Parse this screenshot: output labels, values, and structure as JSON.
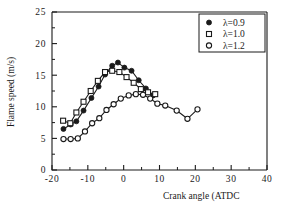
{
  "chart_data": {
    "type": "line",
    "title": "",
    "xlabel": "Crank angle (ATDC",
    "ylabel": "Flame speed (m/s)",
    "xlim": [
      -20,
      40
    ],
    "ylim": [
      0,
      25
    ],
    "xticks": [
      -20,
      -10,
      0,
      10,
      20,
      30,
      40
    ],
    "xtick_labels": [
      "-20",
      "-10",
      "0",
      "10",
      "20",
      "30",
      "40"
    ],
    "xminor_ticks": [
      -15,
      -5,
      5,
      15,
      25,
      35
    ],
    "yticks": [
      0,
      5,
      10,
      15,
      20,
      25
    ],
    "ytick_labels": [
      "0",
      "5",
      "10",
      "15",
      "20",
      "25"
    ],
    "yminor_ticks": [
      2.5,
      7.5,
      12.5,
      17.5,
      22.5
    ],
    "grid": false,
    "legend_position": "top-right",
    "series": [
      {
        "name": "λ=0.9",
        "marker": "filled-circle",
        "x": [
          -16.8,
          -14.8,
          -13.2,
          -11.2,
          -9.0,
          -7.0,
          -5.2,
          -3.2,
          -1.6,
          0.2,
          2.2,
          4.2,
          6.2,
          8.2
        ],
        "y": [
          6.5,
          7.2,
          7.7,
          9.4,
          11.4,
          13.2,
          15.1,
          16.5,
          17.0,
          16.2,
          15.7,
          14.2,
          12.9,
          11.8
        ]
      },
      {
        "name": "λ=1.0",
        "marker": "open-square",
        "x": [
          -16.9,
          -14.9,
          -13.2,
          -11.2,
          -9.2,
          -7.2,
          -5.2,
          -3.2,
          -1.2,
          0.8,
          2.8,
          4.8,
          6.8,
          8.8
        ],
        "y": [
          7.8,
          7.4,
          9.1,
          10.8,
          12.5,
          14.1,
          15.5,
          15.7,
          15.5,
          14.7,
          13.8,
          12.8,
          12.3,
          12.0
        ]
      },
      {
        "name": "λ=1.2",
        "marker": "open-circle",
        "x": [
          -16.8,
          -14.8,
          -12.8,
          -10.8,
          -8.8,
          -6.8,
          -4.8,
          -2.8,
          -0.8,
          1.4,
          3.4,
          5.4,
          7.4,
          9.4,
          11.6,
          14.8,
          17.8,
          20.6
        ],
        "y": [
          4.9,
          4.9,
          5.0,
          6.1,
          7.4,
          8.2,
          9.5,
          10.4,
          11.3,
          11.8,
          12.0,
          11.9,
          11.3,
          10.5,
          10.2,
          9.4,
          8.1,
          9.6
        ]
      }
    ]
  },
  "legend": {
    "items": [
      {
        "label": "λ=0.9",
        "marker": "filled-circle"
      },
      {
        "label": "λ=1.0",
        "marker": "open-square"
      },
      {
        "label": "λ=1.2",
        "marker": "open-circle"
      }
    ]
  },
  "colors": {
    "ink": "#1a1a1a",
    "background": "#ffffff"
  }
}
